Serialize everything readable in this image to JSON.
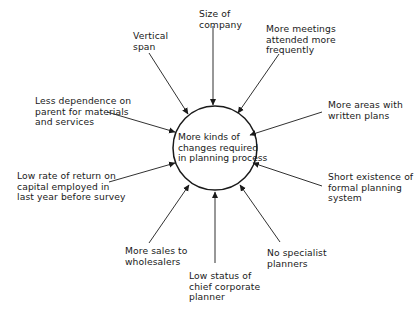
{
  "diagram": {
    "type": "influence-diagram",
    "center": {
      "label": "More kinds of\nchanges required\nin planning process"
    },
    "factors": [
      {
        "id": "vertical-span",
        "label": "Vertical\nspan"
      },
      {
        "id": "size-of-company",
        "label": "Size of\ncompany"
      },
      {
        "id": "more-meetings",
        "label": "More meetings\nattended more\nfrequently"
      },
      {
        "id": "less-dependence",
        "label": "Less dependence on\nparent for materials\nand services"
      },
      {
        "id": "more-areas-written-plans",
        "label": "More areas with\nwritten plans"
      },
      {
        "id": "low-rate-of-return",
        "label": "Low rate of return on\ncapital employed in\nlast year before survey"
      },
      {
        "id": "short-existence",
        "label": "Short existence of\nformal planning\nsystem"
      },
      {
        "id": "more-sales-wholesalers",
        "label": "More sales to\nwholesalers"
      },
      {
        "id": "no-specialist-planners",
        "label": "No specialist\nplanners"
      },
      {
        "id": "low-status-chief-planner",
        "label": "Low status of\nchief corporate\nplanner"
      }
    ],
    "colors": {
      "line": "#1a1a1a",
      "background": "#ffffff"
    }
  }
}
